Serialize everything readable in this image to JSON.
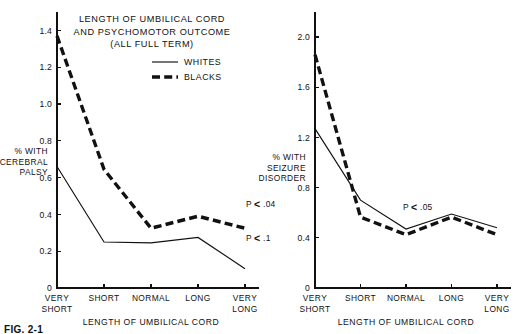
{
  "figure": {
    "caption": "FIG. 2-1"
  },
  "chart_data": [
    {
      "id": "cerebral-palsy",
      "type": "line",
      "title": "LENGTH OF UMBILICAL CORD\nAND PSYCHOMOTOR OUTCOME\n(ALL FULL TERM)",
      "title_lines": [
        "LENGTH OF UMBILICAL CORD",
        "AND PSYCHOMOTOR OUTCOME",
        "(ALL FULL TERM)"
      ],
      "xlabel": "LENGTH OF UMBILICAL CORD",
      "ylabel": "% WITH CEREBRAL PALSY",
      "ylabel_lines": [
        "% WITH",
        "CEREBRAL",
        "PALSY"
      ],
      "categories": [
        "VERY SHORT",
        "SHORT",
        "NORMAL",
        "LONG",
        "VERY LONG"
      ],
      "category_lines": [
        [
          "VERY",
          "SHORT"
        ],
        [
          "SHORT"
        ],
        [
          "NORMAL"
        ],
        [
          "LONG"
        ],
        [
          "VERY",
          "LONG"
        ]
      ],
      "ylim": [
        0,
        1.5
      ],
      "yticks": [
        0,
        0.2,
        0.4,
        0.6,
        0.8,
        1.0,
        1.2,
        1.4
      ],
      "ytick_labels": [
        "0",
        "0.2",
        "0.4",
        "0.6",
        "0.8",
        "1.0",
        "1.2",
        "1.4"
      ],
      "grid": false,
      "legend_position": "upper-right",
      "series": [
        {
          "name": "WHITES",
          "style": "solid",
          "values": [
            0.66,
            0.25,
            0.245,
            0.275,
            0.105
          ]
        },
        {
          "name": "BLACKS",
          "style": "dashed",
          "values": [
            1.37,
            0.645,
            0.325,
            0.39,
            0.325
          ]
        }
      ],
      "annotations": [
        {
          "text": "P",
          "operator": "<",
          "value": ".04",
          "full": "P < .04",
          "series": "BLACKS"
        },
        {
          "text": "P",
          "operator": "<",
          "value": ".1",
          "full": "P < .1",
          "series": "WHITES"
        }
      ]
    },
    {
      "id": "seizure-disorder",
      "type": "line",
      "title": "",
      "title_lines": [],
      "xlabel": "LENGTH OF UMBILICAL CORD",
      "ylabel": "% WITH SEIZURE DISORDER",
      "ylabel_lines": [
        "% WITH",
        "SEIZURE",
        "DISORDER"
      ],
      "categories": [
        "VERY SHORT",
        "SHORT",
        "NORMAL",
        "LONG",
        "VERY LONG"
      ],
      "category_lines": [
        [
          "VERY",
          "SHORT"
        ],
        [
          "SHORT"
        ],
        [
          "NORMAL"
        ],
        [
          "LONG"
        ],
        [
          "VERY",
          "LONG"
        ]
      ],
      "ylim": [
        0,
        2.2
      ],
      "yticks": [
        0,
        0.4,
        0.8,
        1.2,
        1.6,
        2.0
      ],
      "ytick_labels": [
        "0",
        "0.4",
        "0.8",
        "1.2",
        "1.6",
        "2.0"
      ],
      "grid": false,
      "legend_position": "none",
      "series": [
        {
          "name": "WHITES",
          "style": "solid",
          "values": [
            1.27,
            0.7,
            0.47,
            0.59,
            0.48
          ]
        },
        {
          "name": "BLACKS",
          "style": "dashed",
          "values": [
            1.86,
            0.565,
            0.425,
            0.565,
            0.425
          ]
        }
      ],
      "annotations": [
        {
          "text": "P",
          "operator": "<",
          "value": ".05",
          "full": "P < .05",
          "series": "both"
        }
      ]
    }
  ]
}
